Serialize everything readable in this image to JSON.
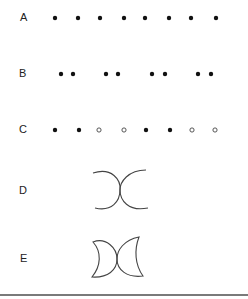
{
  "rows": [
    {
      "label": "A",
      "y": 18,
      "type": "dots",
      "dots": [
        {
          "x": 55,
          "filled": true
        },
        {
          "x": 78,
          "filled": true
        },
        {
          "x": 100,
          "filled": true
        },
        {
          "x": 124,
          "filled": true
        },
        {
          "x": 145,
          "filled": true
        },
        {
          "x": 169,
          "filled": true
        },
        {
          "x": 191,
          "filled": true
        },
        {
          "x": 216,
          "filled": true
        }
      ]
    },
    {
      "label": "B",
      "y": 74,
      "type": "dots",
      "dots": [
        {
          "x": 61,
          "filled": true
        },
        {
          "x": 73,
          "filled": true
        },
        {
          "x": 106,
          "filled": true
        },
        {
          "x": 118,
          "filled": true
        },
        {
          "x": 152,
          "filled": true
        },
        {
          "x": 165,
          "filled": true
        },
        {
          "x": 198,
          "filled": true
        },
        {
          "x": 211,
          "filled": true
        }
      ]
    },
    {
      "label": "C",
      "y": 130,
      "type": "dots",
      "dots": [
        {
          "x": 55,
          "filled": true
        },
        {
          "x": 79,
          "filled": true
        },
        {
          "x": 99,
          "filled": false
        },
        {
          "x": 124,
          "filled": false
        },
        {
          "x": 146,
          "filled": true
        },
        {
          "x": 170,
          "filled": true
        },
        {
          "x": 192,
          "filled": false
        },
        {
          "x": 215,
          "filled": false
        }
      ]
    },
    {
      "label": "D",
      "y": 191,
      "type": "arcs",
      "shape": "two-touching-arcs"
    },
    {
      "label": "E",
      "y": 259,
      "type": "crescents",
      "shape": "two-touching-crescents"
    }
  ],
  "colors": {
    "ink": "#111111",
    "stroke": "#444444",
    "rule": "#7a7a7a"
  }
}
